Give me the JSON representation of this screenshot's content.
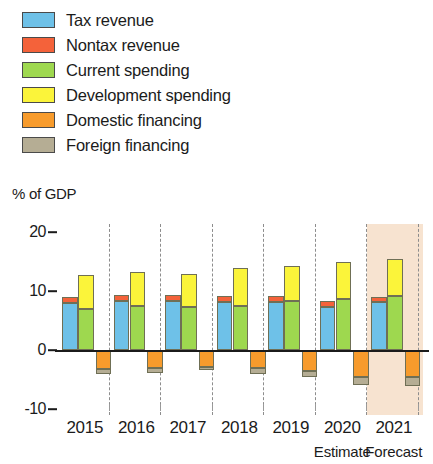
{
  "legend": {
    "items": [
      {
        "label": "Tax revenue",
        "color": "#6ec1e8",
        "key": "tax_revenue"
      },
      {
        "label": "Nontax revenue",
        "color": "#f4623a",
        "key": "nontax_revenue"
      },
      {
        "label": "Current spending",
        "color": "#9ed84f",
        "key": "current_spending"
      },
      {
        "label": "Development spending",
        "color": "#fbf43a",
        "key": "development_spending"
      },
      {
        "label": "Domestic financing",
        "color": "#f79b2c",
        "key": "domestic_financing"
      },
      {
        "label": "Foreign financing",
        "color": "#b5ad94",
        "key": "foreign_financing"
      }
    ]
  },
  "axis_title": "% of GDP",
  "notes": {
    "estimate": "Estimate",
    "forecast": "Forecast"
  },
  "chart_data": {
    "type": "bar",
    "title": "",
    "subtitle": "",
    "xlabel": "",
    "ylabel": "% of GDP",
    "ylim": [
      -12,
      22
    ],
    "yticks": [
      20,
      10,
      0,
      -10
    ],
    "ytick_labels": [
      "20",
      "10",
      "0",
      "-10"
    ],
    "grid": false,
    "legend_position": "top-left",
    "categories": [
      "2015",
      "2016",
      "2017",
      "2018",
      "2019",
      "2020",
      "2021"
    ],
    "stacking": "stacked-grouped",
    "groups": [
      {
        "name": "revenue",
        "segments": [
          "tax_revenue",
          "nontax_revenue"
        ],
        "sign": "positive"
      },
      {
        "name": "spending",
        "segments": [
          "current_spending",
          "development_spending"
        ],
        "sign": "positive"
      },
      {
        "name": "financing",
        "segments": [
          "domestic_financing",
          "foreign_financing"
        ],
        "sign": "negative"
      }
    ],
    "series": [
      {
        "name": "Tax revenue",
        "color": "#6ec1e8",
        "values": [
          7.9,
          8.3,
          8.3,
          8.2,
          8.1,
          7.3,
          8.1
        ]
      },
      {
        "name": "Nontax revenue",
        "color": "#f4623a",
        "values": [
          1.0,
          1.1,
          1.1,
          1.0,
          1.1,
          1.0,
          0.8
        ]
      },
      {
        "name": "Current spending",
        "color": "#9ed84f",
        "values": [
          7.0,
          7.4,
          7.3,
          7.5,
          8.3,
          8.6,
          9.1
        ]
      },
      {
        "name": "Development spending",
        "color": "#fbf43a",
        "values": [
          5.7,
          5.9,
          5.6,
          6.4,
          5.9,
          6.3,
          6.3
        ]
      },
      {
        "name": "Domestic financing",
        "color": "#f79b2c",
        "values": [
          -3.3,
          -3.1,
          -2.8,
          -3.1,
          -3.5,
          -4.6,
          -4.6
        ]
      },
      {
        "name": "Foreign financing",
        "color": "#b5ad94",
        "values": [
          -0.8,
          -0.8,
          -0.6,
          -0.9,
          -1.1,
          -1.4,
          -1.5
        ]
      }
    ],
    "forecast_region": {
      "from_category": "2021",
      "to_category": "2021",
      "color": "#f7e3d0"
    },
    "annotations": [
      {
        "text": "Estimate",
        "at_category": "2020"
      },
      {
        "text": "Forecast",
        "at_category": "2021"
      }
    ]
  }
}
